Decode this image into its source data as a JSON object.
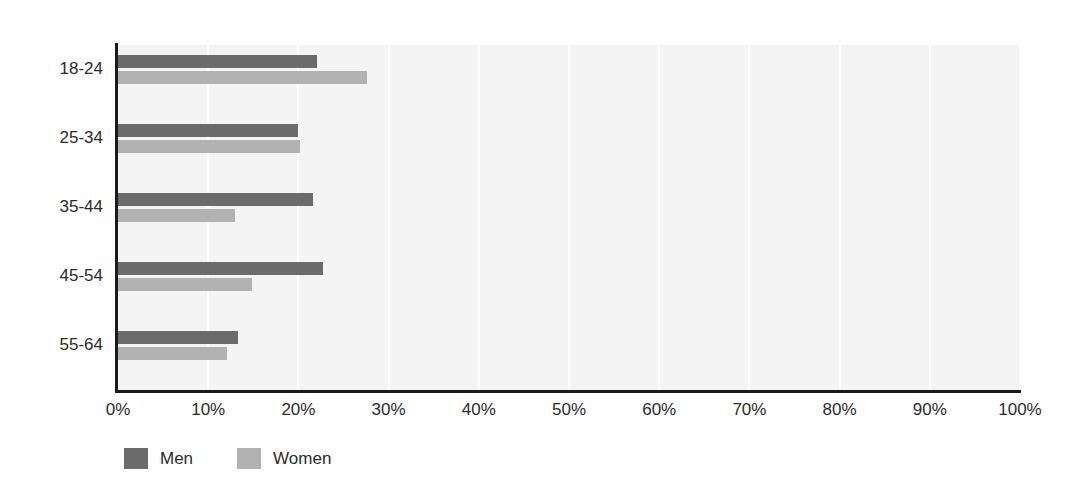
{
  "chart_data": {
    "type": "bar",
    "orientation": "horizontal",
    "title": "",
    "subtitle": "",
    "xlabel": "",
    "ylabel": "",
    "xlim": [
      0,
      100
    ],
    "xtick_labels": [
      "0%",
      "10%",
      "20%",
      "30%",
      "40%",
      "50%",
      "60%",
      "70%",
      "80%",
      "90%",
      "100%"
    ],
    "xtick_values": [
      0,
      10,
      20,
      30,
      40,
      50,
      60,
      70,
      80,
      90,
      100
    ],
    "grid": "vertical",
    "legend_position": "bottom-left",
    "categories": [
      "18-24",
      "25-34",
      "35-44",
      "45-54",
      "55-64"
    ],
    "series": [
      {
        "name": "Men",
        "color": "#6b6b6b",
        "values": [
          22.1,
          20.0,
          21.6,
          22.7,
          13.3
        ]
      },
      {
        "name": "Women",
        "color": "#b2b2b2",
        "values": [
          27.6,
          20.2,
          13.0,
          14.9,
          12.1
        ]
      }
    ]
  },
  "colors": {
    "men": "#6b6b6b",
    "women": "#b2b2b2",
    "plot_background": "#f4f4f4",
    "gridline": "#ffffff",
    "axis": "#1a1a1a",
    "text": "#2b2b2b",
    "page_background": "#ffffff"
  }
}
